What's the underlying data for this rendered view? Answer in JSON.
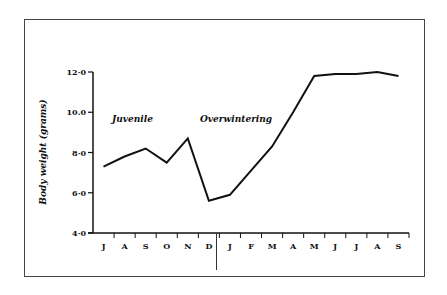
{
  "chart_data": {
    "type": "line",
    "title": "",
    "xlabel": "",
    "ylabel": "Body weight (grams)",
    "ylim": [
      4.0,
      12.0
    ],
    "yticks": [
      "4·0",
      "6·0",
      "8·0",
      "10.0",
      "12·0"
    ],
    "ytick_values": [
      4.0,
      6.0,
      8.0,
      10.0,
      12.0
    ],
    "categories": [
      "J",
      "A",
      "S",
      "O",
      "N",
      "D",
      "J",
      "F",
      "M",
      "A",
      "M",
      "J",
      "J",
      "A",
      "S"
    ],
    "series": [
      {
        "name": "Body weight",
        "values": [
          7.3,
          7.8,
          8.2,
          7.5,
          8.7,
          5.6,
          5.9,
          7.1,
          8.3,
          10.0,
          11.8,
          11.9,
          11.9,
          12.0,
          11.8
        ]
      }
    ],
    "annotations": [
      {
        "text": "Juvenile",
        "period": "J–D"
      },
      {
        "text": "Overwintering",
        "period": "J–S"
      }
    ],
    "grid": false,
    "legend": null,
    "divider_between": [
      "D",
      "J"
    ]
  }
}
